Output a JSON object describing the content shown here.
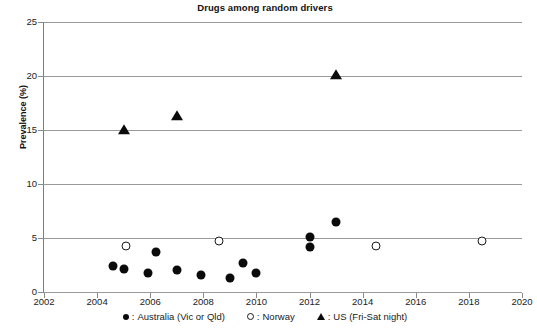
{
  "chart_data": {
    "type": "scatter",
    "title": "Drugs among random drivers",
    "xlabel": "",
    "ylabel": "Prevalence (%)",
    "xlim": [
      2002,
      2020
    ],
    "ylim": [
      0,
      25
    ],
    "xticks": [
      2002,
      2004,
      2006,
      2008,
      2010,
      2012,
      2014,
      2016,
      2018,
      2020
    ],
    "yticks": [
      0,
      5,
      10,
      15,
      20,
      25
    ],
    "grid": "horizontal",
    "legend_position": "bottom",
    "series": [
      {
        "name": "Australia (Vic or Qld)",
        "marker": "filled-circle",
        "color": "#0b0b0b",
        "points": [
          {
            "x": 2004.6,
            "y": 2.4
          },
          {
            "x": 2005.0,
            "y": 2.1
          },
          {
            "x": 2005.9,
            "y": 1.8
          },
          {
            "x": 2006.2,
            "y": 3.7
          },
          {
            "x": 2007.0,
            "y": 2.0
          },
          {
            "x": 2007.9,
            "y": 1.6
          },
          {
            "x": 2009.0,
            "y": 1.3
          },
          {
            "x": 2009.5,
            "y": 2.7
          },
          {
            "x": 2010.0,
            "y": 1.8
          },
          {
            "x": 2012.0,
            "y": 5.1
          },
          {
            "x": 2012.0,
            "y": 4.2
          },
          {
            "x": 2013.0,
            "y": 6.5
          }
        ]
      },
      {
        "name": "Norway",
        "marker": "open-circle",
        "color": "#1a1a1a",
        "points": [
          {
            "x": 2005.1,
            "y": 4.3
          },
          {
            "x": 2008.6,
            "y": 4.7
          },
          {
            "x": 2014.5,
            "y": 4.3
          },
          {
            "x": 2018.5,
            "y": 4.7
          }
        ]
      },
      {
        "name": "US (Fri-Sat night)",
        "marker": "filled-triangle",
        "color": "#0b0b0b",
        "points": [
          {
            "x": 2005.0,
            "y": 15.0
          },
          {
            "x": 2007.0,
            "y": 16.3
          },
          {
            "x": 2013.0,
            "y": 20.1
          }
        ]
      }
    ],
    "legend": [
      {
        "marker": "filled-circle",
        "separator": ":",
        "label": "Australia (Vic or Qld)"
      },
      {
        "marker": "open-circle",
        "separator": ":",
        "label": "Norway"
      },
      {
        "marker": "filled-triangle",
        "separator": ":",
        "label": "US (Fri-Sat night)"
      }
    ]
  }
}
